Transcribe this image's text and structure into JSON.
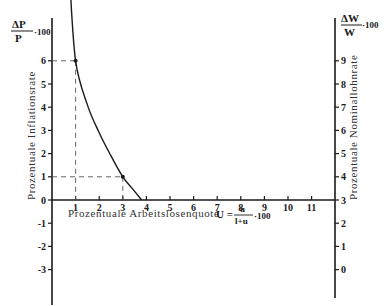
{
  "chart_data": {
    "type": "line",
    "title": "",
    "subtitle": "Phillips-Kurve",
    "xlabel": "Prozentuale Arbeitslosenquote",
    "xformula": {
      "lhs": "U =",
      "numerator": "u",
      "denominator": "l+u",
      "suffix": "·100"
    },
    "ylabel_left": "Prozentuale Inflationsrate",
    "ylabel_left_header": {
      "numerator": "ΔP",
      "denominator": "P",
      "suffix": "·100"
    },
    "ylabel_right": "Prozentuale Nominallohnrate",
    "ylabel_right_header": {
      "numerator": "ΔW",
      "denominator": "W",
      "suffix": "·100"
    },
    "x_ticks": [
      "1",
      "2",
      "3",
      "4",
      "5",
      "6",
      "7",
      "8",
      "9",
      "10",
      "11"
    ],
    "y_left_ticks": [
      "6",
      "5",
      "4",
      "3",
      "2",
      "1",
      "0",
      "-1",
      "-2",
      "-3"
    ],
    "y_right_ticks": [
      "9",
      "8",
      "7",
      "6",
      "5",
      "4",
      "3",
      "2",
      "1",
      "0"
    ],
    "xlim": [
      0,
      12
    ],
    "ylim_left": [
      -4,
      9.5
    ],
    "ylim_right": [
      -1,
      12.5
    ],
    "right_axis_offset": 3,
    "grid": false,
    "legend": null,
    "series": [
      {
        "name": "Phillips-Kurve",
        "x": [
          0.75,
          1.0,
          1.5,
          2.0,
          2.5,
          3.0,
          3.4,
          3.8
        ],
        "y": [
          9.5,
          6.0,
          4.1,
          2.9,
          1.9,
          1.0,
          0.5,
          0.0
        ]
      }
    ],
    "highlighted_points": [
      {
        "x": 1,
        "y": 6,
        "y_right": 9
      },
      {
        "x": 3,
        "y": 1,
        "y_right": 4
      }
    ],
    "reference_lines": "dashed lines from highlighted points to both axes"
  }
}
